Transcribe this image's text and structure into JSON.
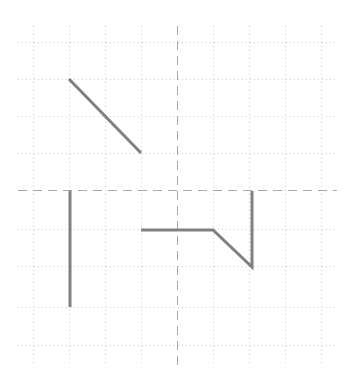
{
  "canvas": {
    "width": 345,
    "height": 383,
    "background": "#ffffff",
    "title": ""
  },
  "grid": {
    "minor_color": "#c9c9c9",
    "major_color": "#a9a9a9",
    "minor_width": 1,
    "major_width": 1,
    "minor_dash": "1,3",
    "major_dash": "9,6",
    "spacing_x": 36,
    "spacing_y": 38,
    "x_lines": [
      33,
      69,
      105,
      141,
      177,
      213,
      249,
      285,
      321
    ],
    "y_lines": [
      42,
      79,
      116,
      153,
      190,
      229,
      266,
      307,
      345
    ],
    "major_x": 177,
    "major_y": 190,
    "extent": {
      "x0": 18,
      "x1": 337,
      "y0": 26,
      "y1": 365
    }
  },
  "series": {
    "color": "#808080",
    "width": 3,
    "linecap": "butt",
    "linejoin": "miter",
    "paths": [
      {
        "name": "descending-diagonal",
        "points": [
          [
            69,
            79
          ],
          [
            141,
            153
          ]
        ]
      },
      {
        "name": "left-vertical-drop",
        "points": [
          [
            70,
            191
          ],
          [
            70,
            307
          ]
        ]
      },
      {
        "name": "plateau-dip-spike",
        "points": [
          [
            141,
            230
          ],
          [
            213,
            230
          ],
          [
            252,
            267
          ],
          [
            252,
            191
          ]
        ]
      }
    ]
  },
  "chart_data": {
    "type": "line",
    "title": "",
    "subtitle": "",
    "xlabel": "",
    "ylabel": "",
    "xlim": [
      0,
      9
    ],
    "ylim": [
      0,
      9
    ],
    "grid": true,
    "legend": null,
    "tick_labels": {
      "x": [],
      "y": []
    },
    "annotations": [],
    "note": "Gridded plot with three disconnected gray polyline segments; no axis tick labels are rendered.",
    "series": [
      {
        "name": "descending-diagonal",
        "x": [
          1,
          3
        ],
        "y": [
          7,
          5
        ],
        "style": "solid"
      },
      {
        "name": "left-vertical-drop",
        "x": [
          1.03,
          1.03
        ],
        "y": [
          4,
          1
        ],
        "style": "solid"
      },
      {
        "name": "plateau-dip-spike",
        "x": [
          3,
          5,
          6.1,
          6.1
        ],
        "y": [
          3,
          3,
          2,
          4
        ],
        "style": "solid"
      }
    ]
  }
}
